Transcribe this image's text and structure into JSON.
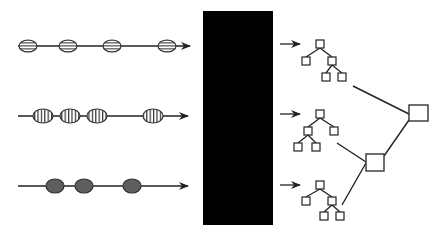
{
  "colors": {
    "background": "#ffffff",
    "stroke": "#222222",
    "black_box": "#000000",
    "ellipse_striped_fill": "#8a8a8a",
    "ellipse_dark_fill": "#5e5e5e",
    "node_fill": "#ffffff"
  },
  "streams": [
    {
      "id": "stream-horizontal-stripes",
      "y": 46,
      "line_start": 18,
      "line_end": 190,
      "pattern": "horizontal-stripes",
      "ellipses": [
        28,
        68,
        112,
        167
      ],
      "rx": 9,
      "ry": 6
    },
    {
      "id": "stream-vertical-stripes",
      "y": 116,
      "line_start": 18,
      "line_end": 188,
      "pattern": "vertical-stripes",
      "ellipses": [
        43,
        70,
        97,
        153
      ],
      "rx": 10,
      "ry": 7
    },
    {
      "id": "stream-solid",
      "y": 186,
      "line_start": 18,
      "line_end": 188,
      "pattern": "solid",
      "ellipses": [
        55,
        84,
        132
      ],
      "rx": 9,
      "ry": 7
    }
  ],
  "black_box": {
    "x": 203,
    "y": 11,
    "width": 70,
    "height": 214
  },
  "output_arrows": [
    {
      "x1": 280,
      "x2": 300,
      "y": 44
    },
    {
      "x1": 280,
      "x2": 300,
      "y": 114
    },
    {
      "x1": 280,
      "x2": 300,
      "y": 185
    }
  ],
  "trees": [
    {
      "id": "tree-1",
      "nodes": [
        [
          320,
          44
        ],
        [
          306,
          61
        ],
        [
          332,
          61
        ],
        [
          326,
          77
        ],
        [
          342,
          77
        ]
      ],
      "edges": [
        [
          0,
          1
        ],
        [
          0,
          2
        ],
        [
          2,
          3
        ],
        [
          2,
          4
        ]
      ]
    },
    {
      "id": "tree-2",
      "nodes": [
        [
          320,
          114
        ],
        [
          308,
          131
        ],
        [
          334,
          131
        ],
        [
          298,
          147
        ],
        [
          316,
          147
        ]
      ],
      "edges": [
        [
          0,
          1
        ],
        [
          0,
          2
        ],
        [
          1,
          3
        ],
        [
          1,
          4
        ]
      ]
    },
    {
      "id": "tree-3",
      "nodes": [
        [
          320,
          185
        ],
        [
          306,
          201
        ],
        [
          332,
          201
        ],
        [
          324,
          216
        ],
        [
          340,
          216
        ]
      ],
      "edges": [
        [
          0,
          1
        ],
        [
          0,
          2
        ],
        [
          2,
          3
        ],
        [
          2,
          4
        ]
      ]
    }
  ],
  "tree_node_size": 8,
  "big_nodes": [
    {
      "id": "merge-node-top",
      "x": 409,
      "y": 105,
      "width": 19,
      "height": 16
    },
    {
      "id": "merge-node-lower",
      "x": 366,
      "y": 154,
      "width": 18,
      "height": 17
    }
  ],
  "connectors": [
    [
      353,
      86,
      409,
      114
    ],
    [
      337,
      143,
      366,
      162
    ],
    [
      342,
      205,
      366,
      163
    ],
    [
      384,
      156,
      409,
      120
    ]
  ]
}
